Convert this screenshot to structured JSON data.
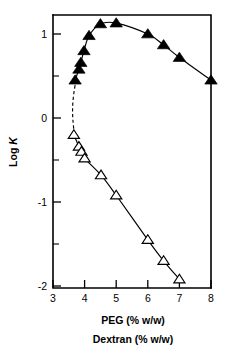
{
  "figure": {
    "background_color": "#ffffff",
    "ink_color": "#000000"
  },
  "axes": {
    "x": {
      "label_line1": "PEG (% w/w)",
      "label_line2": "Dextran (% w/w)",
      "tick_labels": [
        "3",
        "4",
        "5",
        "6",
        "7",
        "8"
      ],
      "tick_values": [
        3,
        4,
        5,
        6,
        7,
        8
      ],
      "min": 3,
      "max": 8
    },
    "y": {
      "label_prefix": "Log ",
      "label_italic": "K",
      "tick_labels": [
        "1",
        "0",
        "-1",
        "-2"
      ],
      "tick_values": [
        1,
        0,
        -1,
        -2
      ],
      "minor_tick_values": [
        0.5,
        -0.5,
        -1.5
      ],
      "min": -2,
      "max": 1.3
    }
  },
  "chart_data": {
    "type": "scatter",
    "title": "",
    "xlabel": "PEG (% w/w) / Dextran (% w/w)",
    "ylabel": "Log K",
    "xlim": [
      3,
      8
    ],
    "ylim": [
      -2,
      1.3
    ],
    "grid": false,
    "legend": "none",
    "series": [
      {
        "name": "PEG (% w/w)",
        "marker": "filled-triangle-up",
        "marker_color": "#000000",
        "line": "solid",
        "points": [
          {
            "x": 3.7,
            "y": 0.45
          },
          {
            "x": 3.82,
            "y": 0.58
          },
          {
            "x": 3.88,
            "y": 0.66
          },
          {
            "x": 3.98,
            "y": 0.8
          },
          {
            "x": 4.14,
            "y": 0.98
          },
          {
            "x": 4.5,
            "y": 1.12
          },
          {
            "x": 5.0,
            "y": 1.13
          },
          {
            "x": 6.0,
            "y": 1.0
          },
          {
            "x": 6.5,
            "y": 0.87
          },
          {
            "x": 7.0,
            "y": 0.72
          },
          {
            "x": 8.0,
            "y": 0.45
          }
        ]
      },
      {
        "name": "Dextran (% w/w)",
        "marker": "open-triangle-up",
        "marker_color": "#ffffff",
        "marker_edge_color": "#000000",
        "line": "solid",
        "points": [
          {
            "x": 3.66,
            "y": -0.2
          },
          {
            "x": 3.82,
            "y": -0.34
          },
          {
            "x": 3.9,
            "y": -0.4
          },
          {
            "x": 4.0,
            "y": -0.48
          },
          {
            "x": 4.52,
            "y": -0.68
          },
          {
            "x": 5.0,
            "y": -0.92
          },
          {
            "x": 6.0,
            "y": -1.45
          },
          {
            "x": 6.5,
            "y": -1.7
          },
          {
            "x": 7.0,
            "y": -1.92
          }
        ]
      }
    ],
    "connector": {
      "line": "dashed",
      "from": {
        "x": 3.7,
        "y": 0.45
      },
      "to": {
        "x": 3.66,
        "y": -0.2
      },
      "note": "dashed segment joining the two branches"
    }
  }
}
